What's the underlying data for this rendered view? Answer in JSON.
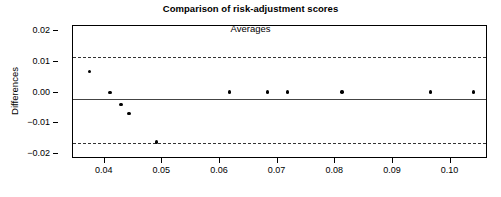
{
  "chart_data": {
    "type": "scatter",
    "title": "Comparison of risk-adjustment scores",
    "xlabel": "Averages",
    "ylabel": "Differences",
    "xlim": [
      0.0345,
      0.1065
    ],
    "ylim": [
      -0.0215,
      0.0215
    ],
    "grid": false,
    "legend": null,
    "xticks": [
      0.04,
      0.05,
      0.06,
      0.07,
      0.08,
      0.09,
      0.1
    ],
    "xtick_labels": [
      "0.04",
      "0.05",
      "0.06",
      "0.07",
      "0.08",
      "0.09",
      "0.10"
    ],
    "yticks": [
      0.02,
      0.01,
      0.0,
      -0.01,
      -0.02
    ],
    "ytick_labels": [
      "0.02",
      "0.01",
      "0.00",
      "-0.01",
      "-0.02"
    ],
    "x": [
      0.0374,
      0.0409,
      0.0428,
      0.0442,
      0.049,
      0.0617,
      0.0682,
      0.0717,
      0.0812,
      0.0965,
      0.104
    ],
    "y": [
      0.0068,
      0.0001,
      -0.0039,
      -0.0067,
      -0.016,
      0.0002,
      0.0002,
      0.0002,
      0.0002,
      0.0002,
      0.0002
    ],
    "points": [
      {
        "x": 0.0374,
        "y": 0.0068
      },
      {
        "x": 0.0409,
        "y": 0.0001
      },
      {
        "x": 0.0428,
        "y": -0.0039
      },
      {
        "x": 0.0442,
        "y": -0.0067
      },
      {
        "x": 0.049,
        "y": -0.016
      },
      {
        "x": 0.0617,
        "y": 0.0002
      },
      {
        "x": 0.0682,
        "y": 0.0002
      },
      {
        "x": 0.0717,
        "y": 0.0002
      },
      {
        "x": 0.0812,
        "y": 0.0002
      },
      {
        "x": 0.0965,
        "y": 0.0002
      },
      {
        "x": 0.104,
        "y": 0.0002
      }
    ],
    "reference_lines": [
      {
        "name": "upper-limit-of-agreement",
        "value": 0.0115,
        "style": "dashed"
      },
      {
        "name": "mean-difference",
        "value": -0.0022,
        "style": "solid"
      },
      {
        "name": "lower-limit-of-agreement",
        "value": -0.0162,
        "style": "dashed"
      }
    ],
    "colors": {
      "point": "#000000",
      "mean_line": "#444444",
      "limit_line": "#333333",
      "axis": "#000000",
      "background": "#ffffff"
    }
  }
}
